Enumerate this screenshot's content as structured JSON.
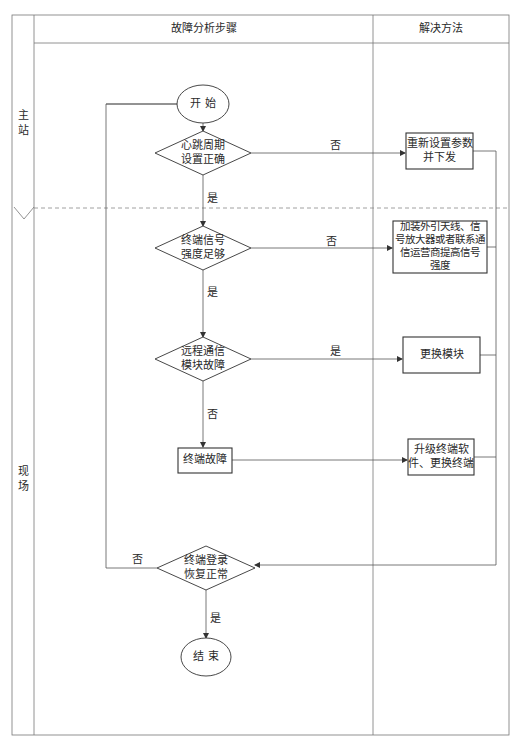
{
  "header": {
    "steps_column": "故障分析步骤",
    "solutions_column": "解决方法"
  },
  "lanes": [
    {
      "label": "主\n站"
    },
    {
      "label": "现\n场"
    }
  ],
  "nodes": {
    "start": "开  始",
    "heartbeat_check": "心跳周期\n设置正确",
    "signal_check": "终端信号\n强度足够",
    "module_check": "远程通信\n模块故障",
    "terminal_fault": "终端故障",
    "login_check": "终端登录\n恢复正常",
    "end": "结  束"
  },
  "solutions": {
    "reset_params": "重新设置参数\n并下发",
    "boost_signal": "加装外引天线、信\n号放大器或者联系通\n信运营商提高信号\n强度",
    "replace_module": "更换模块",
    "upgrade_terminal": "升级终端软\n件、更换终端"
  },
  "edge_labels": {
    "heartbeat_no": "否",
    "heartbeat_yes": "是",
    "signal_no": "否",
    "signal_yes": "是",
    "module_yes": "是",
    "module_no": "否",
    "login_no": "否",
    "login_yes": "是"
  },
  "colors": {
    "line": "#555555",
    "box_border": "#333333",
    "background": "#ffffff"
  }
}
